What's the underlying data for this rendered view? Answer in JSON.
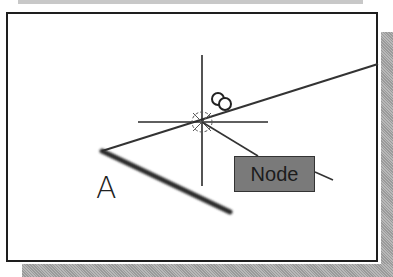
{
  "diagram": {
    "point_label": "A",
    "tooltip": {
      "label": "Node"
    },
    "snap_type": "node-osnap-icon",
    "colors": {
      "frame_border": "#1e1e1e",
      "line": "#333333",
      "thick_line": "#2a2a2a",
      "tooltip_fill": "#7a7a7a",
      "shadow": "#a8a8a8"
    }
  }
}
